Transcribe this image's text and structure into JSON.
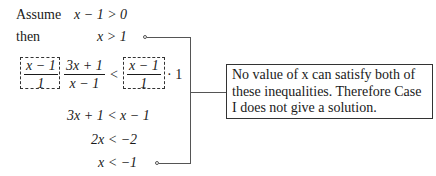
{
  "steps": {
    "assume_label": "Assume",
    "assume_expr": "x − 1 > 0",
    "then_label": "then",
    "then_expr": "x > 1",
    "mult_left_num": "x − 1",
    "mult_left_den": "1",
    "main_num": "3x + 1",
    "main_den": "x − 1",
    "lt": "<",
    "mult_right_num": "x − 1",
    "mult_right_den": "1",
    "times_one": "· 1",
    "line3": "3x + 1 < x − 1",
    "line4": "2x < −2",
    "line5": "x < −1"
  },
  "note": {
    "text": "No value of x can satisfy both of these inequalities. Therefore Case I does not give a solution."
  },
  "colors": {
    "text": "#1a1a1a",
    "lines": "#555555",
    "background": "#ffffff"
  }
}
